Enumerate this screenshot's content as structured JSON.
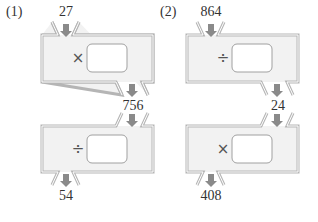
{
  "problems": [
    {
      "label": "(1)",
      "input": "27",
      "machine1": {
        "operator": "×",
        "operator_name": "multiply",
        "box": ""
      },
      "middle": "756",
      "machine2": {
        "operator": "÷",
        "operator_name": "divide",
        "box": ""
      },
      "output": "54"
    },
    {
      "label": "(2)",
      "input": "864",
      "machine1": {
        "operator": "÷",
        "operator_name": "divide",
        "box": ""
      },
      "middle": "24",
      "machine2": {
        "operator": "×",
        "operator_name": "multiply",
        "box": ""
      },
      "output": "408"
    }
  ],
  "colors": {
    "machine_fill": "#f2f2f2",
    "machine_border": "#b5b5b5",
    "arrow": "#8a8a8a",
    "box_fill": "#ffffff",
    "text": "#333333"
  }
}
